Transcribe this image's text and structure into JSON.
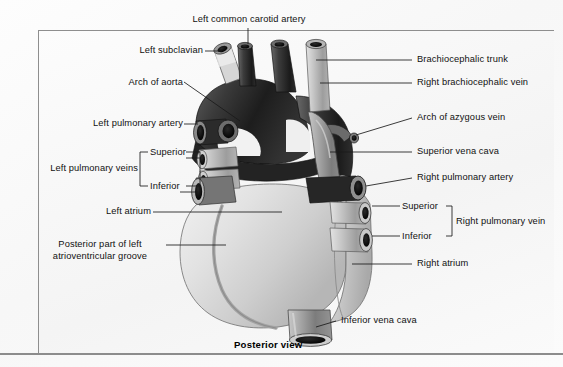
{
  "figure": {
    "caption": "Posterior view",
    "view_title": "Posterior view of the heart"
  },
  "colors": {
    "background": "#fbfbfb",
    "frame_border": "#8e8e8e",
    "leader_line": "#1a1a1a",
    "label_text": "#111111",
    "aorta_dark": "#2b2b2b",
    "great_vessel_mid": "#8f8f8f",
    "heart_body_light": "#dcdcdc",
    "groove_gray": "#a8a8a8",
    "lumen_black": "#0d0d0d"
  },
  "labels": {
    "left_common_carotid_artery": "Left common carotid artery",
    "left_subclavian": "Left subclavian",
    "arch_of_aorta": "Arch of aorta",
    "left_pulmonary_artery": "Left pulmonary artery",
    "left_pulmonary_veins": "Left pulmonary veins",
    "left_pv_superior": "Superior",
    "left_pv_inferior": "Inferior",
    "left_atrium": "Left atrium",
    "posterior_part_of_left_av_groove": "Posterior part of left atrioventricular groove",
    "brachiocephalic_trunk": "Brachiocephalic trunk",
    "right_brachiocephalic_vein": "Right  brachiocephalic vein",
    "arch_of_azygous_vein": "Arch of azygous vein",
    "superior_vena_cava": "Superior vena cava",
    "right_pulmonary_artery": "Right pulmonary artery",
    "right_pv_superior": "Superior",
    "right_pv_inferior": "Inferior",
    "right_pulmonary_vein": "Right pulmonary vein",
    "right_atrium": "Right atrium",
    "inferior_vena_cava": "Inferior vena cava"
  }
}
